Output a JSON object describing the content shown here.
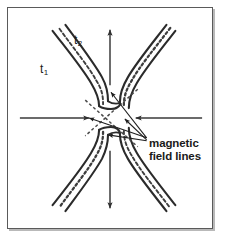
{
  "figure": {
    "kind": "magnetic-reconnection-diagram",
    "background_color": "#ffffff",
    "border_color": "#5a5a5a",
    "shadow_color": "#b9b9b9",
    "line_color": "#2b2b2b",
    "arrow_color": "#3a3a3a",
    "dashed_color": "#4a4a4a"
  },
  "labels": {
    "t1": {
      "base": "t",
      "sub": "1"
    },
    "t2": {
      "base": "t",
      "sub": "2"
    },
    "annotation": {
      "line1": "magnetic",
      "line2": "field lines"
    }
  },
  "arrows": {
    "top": {
      "name": "outflow-arrow-up",
      "direction": "up"
    },
    "bottom": {
      "name": "outflow-arrow-down",
      "direction": "down"
    },
    "left": {
      "name": "inflow-arrow-right",
      "direction": "right"
    },
    "right": {
      "name": "inflow-arrow-left",
      "direction": "left"
    }
  },
  "field_line_bundles": [
    {
      "name": "bundle-upper-left",
      "style": "solid-pair-with-dashed-center"
    },
    {
      "name": "bundle-upper-right",
      "style": "solid-pair-with-dotted-center"
    },
    {
      "name": "bundle-lower-left",
      "style": "solid-pair-with-dotted-center"
    },
    {
      "name": "bundle-lower-right",
      "style": "solid-pair-with-dashed-center"
    }
  ],
  "leader_lines": {
    "name": "annotation-leader-lines",
    "count": 3,
    "targets": [
      "upper-field-line",
      "mid-field-line",
      "lower-field-line"
    ]
  }
}
